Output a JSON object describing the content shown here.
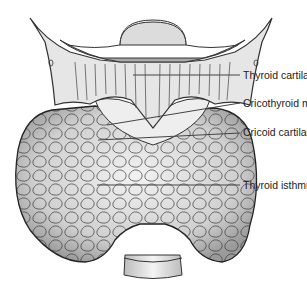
{
  "diagram": {
    "labels": [
      {
        "text": "Thyroid cartilage",
        "x": 243,
        "y": 76
      },
      {
        "text": "Cricothyroid membrane",
        "x": 243,
        "y": 104
      },
      {
        "text": "Cricoid cartilage",
        "x": 243,
        "y": 133
      },
      {
        "text": "Thyroid isthmus",
        "x": 243,
        "y": 186
      }
    ]
  }
}
